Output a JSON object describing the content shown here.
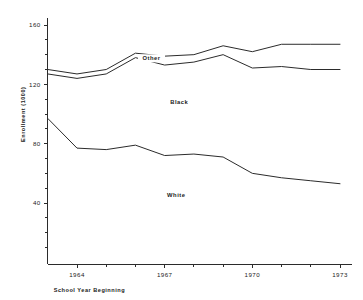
{
  "chart_data": {
    "type": "line",
    "title": "",
    "xlabel": "School Year Beginning",
    "ylabel": "Enrollment (1000)",
    "grid": false,
    "legend_position": "inline-annotations",
    "x": [
      1963,
      1964,
      1965,
      1966,
      1967,
      1968,
      1969,
      1970,
      1971,
      1972,
      1973
    ],
    "xlim": [
      1963,
      1973
    ],
    "ylim": [
      0,
      168
    ],
    "x_tick_labels": [
      "1964",
      "1967",
      "1970",
      "1973"
    ],
    "x_tick_values": [
      1964,
      1967,
      1970,
      1973
    ],
    "y_tick_labels": [
      "40",
      "80",
      "120",
      "160"
    ],
    "y_tick_values": [
      40,
      80,
      120,
      160
    ],
    "y_minor_step": 10,
    "annotations": [
      {
        "text": "Other",
        "x": 1966.55,
        "y": 136.5
      },
      {
        "text": "Black",
        "x": 1967.5,
        "y": 107.0
      },
      {
        "text": "White",
        "x": 1967.4,
        "y": 44.0
      }
    ],
    "series": [
      {
        "name": "Other",
        "role": "cumulative-top",
        "values": [
          130,
          127,
          130,
          141,
          139,
          140,
          146,
          142,
          147,
          147,
          147
        ]
      },
      {
        "name": "Black",
        "role": "cumulative-middle",
        "values": [
          127,
          124,
          127,
          138,
          133,
          135,
          140,
          131,
          132,
          130,
          130
        ]
      },
      {
        "name": "White",
        "role": "cumulative-bottom",
        "values": [
          97,
          77,
          76,
          79,
          72,
          73,
          71,
          60,
          57,
          55,
          53
        ]
      }
    ]
  },
  "colors": {
    "line": "#2b2b2b",
    "axis": "#2b2b2b",
    "background": "#ffffff",
    "text": "#1a1a1a"
  }
}
